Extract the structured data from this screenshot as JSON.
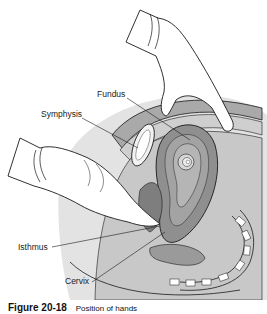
{
  "figure": {
    "labels": {
      "fundus": "Fundus",
      "symphysis": "Symphysis",
      "isthmus": "Isthmus",
      "cervix": "Cervix"
    },
    "caption": {
      "number": "Figure 20-18",
      "text": "Position of hands"
    },
    "colors": {
      "tissue_light": "#d9d9d9",
      "tissue_mid": "#b3b3b3",
      "tissue_dark": "#8c8c8c",
      "outline": "#1a1a1a",
      "glove": "#ffffff"
    }
  }
}
